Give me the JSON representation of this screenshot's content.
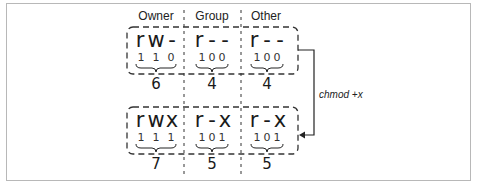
{
  "diagram": {
    "columns": [
      "Owner",
      "Group",
      "Other"
    ],
    "before": {
      "groups": [
        {
          "symbols": [
            "r",
            "w",
            "-"
          ],
          "bits": [
            "1",
            "1",
            "0"
          ],
          "octal": "6"
        },
        {
          "symbols": [
            "r",
            "-",
            "-"
          ],
          "bits": [
            "1",
            "0",
            "0"
          ],
          "octal": "4"
        },
        {
          "symbols": [
            "r",
            "-",
            "-"
          ],
          "bits": [
            "1",
            "0",
            "0"
          ],
          "octal": "4"
        }
      ]
    },
    "after": {
      "groups": [
        {
          "symbols": [
            "r",
            "w",
            "x"
          ],
          "bits": [
            "1",
            "1",
            "1"
          ],
          "octal": "7"
        },
        {
          "symbols": [
            "r",
            "-",
            "x"
          ],
          "bits": [
            "1",
            "0",
            "1"
          ],
          "octal": "5"
        },
        {
          "symbols": [
            "r",
            "-",
            "x"
          ],
          "bits": [
            "1",
            "0",
            "1"
          ],
          "octal": "5"
        }
      ]
    },
    "arrow_label": "chmod +x",
    "colors": {
      "frame": "#b8b8b8",
      "ink": "#1a1a1a",
      "dash": "#333333"
    }
  }
}
